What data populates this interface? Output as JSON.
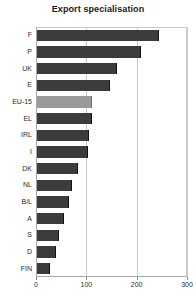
{
  "chart_data": {
    "type": "bar",
    "orientation": "horizontal",
    "title": "Export specialisation",
    "xlabel": "",
    "ylabel": "",
    "categories": [
      "F",
      "P",
      "UK",
      "E",
      "EU-15",
      "EL",
      "IRL",
      "I",
      "DK",
      "NL",
      "B/L",
      "A",
      "S",
      "D",
      "FIN"
    ],
    "values": [
      245,
      209,
      161,
      147,
      111,
      111,
      105,
      104,
      83,
      72,
      66,
      56,
      45,
      40,
      28
    ],
    "xlim": [
      0,
      300
    ],
    "xticks": [
      0,
      100,
      200,
      300
    ],
    "xtick_labels": [
      "0",
      "100",
      "200",
      "300"
    ],
    "grid": true,
    "grid_axis": "x",
    "legend": "none",
    "highlight_category": "EU-15",
    "colors": {
      "bar": "#3c3c3c",
      "highlight_bar": "#9a9a9a",
      "grid": "#c9c9c9",
      "axis": "#a8a8a8",
      "text": "#2b2b2b",
      "title": "#1a1a1a",
      "background": "#ffffff"
    }
  }
}
